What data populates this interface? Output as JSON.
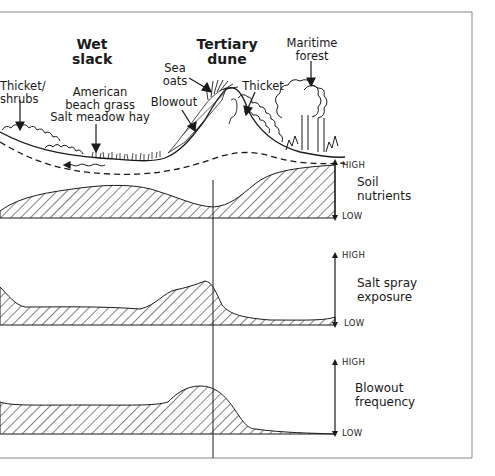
{
  "zones": {
    "wet_slack": {
      "line1": "Wet",
      "line2": "slack"
    },
    "tertiary_dune": {
      "line1": "Tertiary",
      "line2": "dune"
    }
  },
  "vegetation": {
    "thicket_shrubs": {
      "line1": "Thicket/",
      "line2": "shrubs"
    },
    "beach_grass": {
      "line1": "American",
      "line2": "beach grass",
      "line3": "Salt meadow hay"
    },
    "sea_oats": {
      "line1": "Sea",
      "line2": "oats"
    },
    "blowout": "Blowout",
    "thicket": "Thicket",
    "maritime_forest": {
      "line1": "Maritime",
      "line2": "forest"
    }
  },
  "panels": [
    {
      "name": "Soil nutrients",
      "line1": "Soil",
      "line2": "nutrients",
      "high": "HIGH",
      "low": "LOW"
    },
    {
      "name": "Salt spray exposure",
      "line1": "Salt spray",
      "line2": "exposure",
      "high": "HIGH",
      "low": "LOW"
    },
    {
      "name": "Blowout frequency",
      "line1": "Blowout",
      "line2": "frequency",
      "high": "HIGH",
      "low": "LOW"
    }
  ],
  "colors": {
    "ink": "#1a1a1a",
    "frame": "#888888",
    "background": "#ffffff"
  }
}
